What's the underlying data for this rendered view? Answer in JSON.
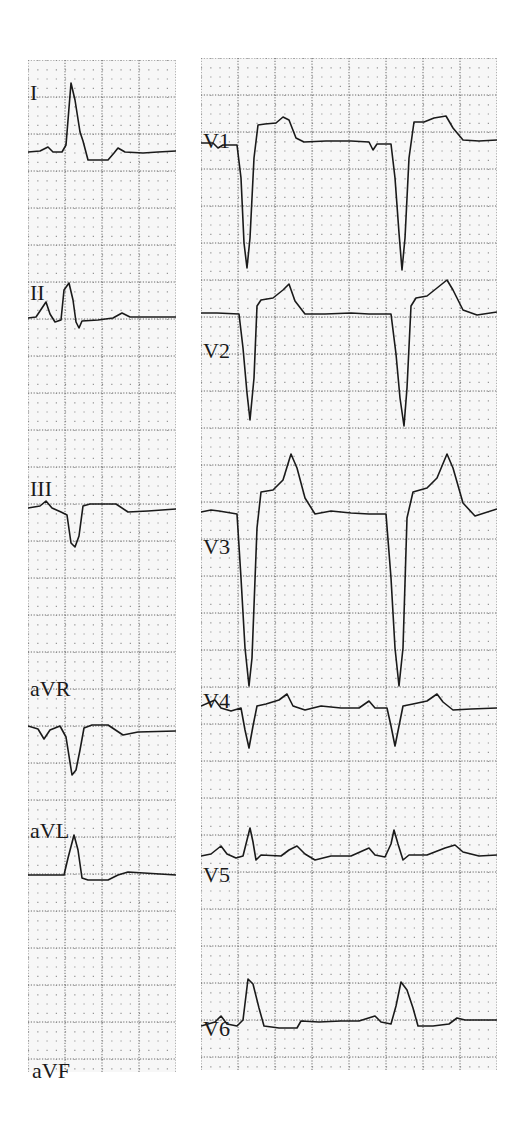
{
  "figure": {
    "type": "12-lead ECG",
    "colors": {
      "paper": "#f7f7f7",
      "grid": "#6a6a6a",
      "trace": "#1a1a1a"
    },
    "grid": {
      "major_px": 37,
      "minor_px": 9.25
    }
  },
  "left_strip": {
    "leads": [
      {
        "name": "I",
        "label_x": 2,
        "label_y": 22
      },
      {
        "name": "II",
        "label_x": 2,
        "label_y": 222
      },
      {
        "name": "III",
        "label_x": 2,
        "label_y": 418
      },
      {
        "name": "aVR",
        "label_x": 2,
        "label_y": 618
      },
      {
        "name": "aVL",
        "label_x": 2,
        "label_y": 760
      },
      {
        "name": "aVF",
        "label_x": 4,
        "label_y": 1000
      }
    ]
  },
  "right_strip": {
    "leads": [
      {
        "name": "V1",
        "label_x": 2,
        "label_y": 72
      },
      {
        "name": "V2",
        "label_x": 2,
        "label_y": 282
      },
      {
        "name": "V3",
        "label_x": 2,
        "label_y": 478
      },
      {
        "name": "V4",
        "label_x": 2,
        "label_y": 632
      },
      {
        "name": "V5",
        "label_x": 2,
        "label_y": 806
      },
      {
        "name": "V6",
        "label_x": 2,
        "label_y": 960
      }
    ]
  }
}
